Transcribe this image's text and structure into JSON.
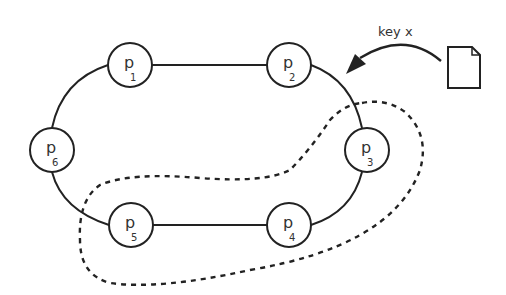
{
  "diagram": {
    "type": "ring-topology",
    "key_label": "key x",
    "nodes": [
      {
        "id": "p1",
        "label": "p",
        "sub": "1",
        "cx": 130,
        "cy": 65
      },
      {
        "id": "p2",
        "label": "p",
        "sub": "2",
        "cx": 289,
        "cy": 65
      },
      {
        "id": "p3",
        "label": "p",
        "sub": "3",
        "cx": 367,
        "cy": 150
      },
      {
        "id": "p4",
        "label": "p",
        "sub": "4",
        "cx": 289,
        "cy": 225
      },
      {
        "id": "p5",
        "label": "p",
        "sub": "5",
        "cx": 131,
        "cy": 225
      },
      {
        "id": "p6",
        "label": "p",
        "sub": "6",
        "cx": 52,
        "cy": 150
      }
    ],
    "edges": [
      [
        "p1",
        "p2"
      ],
      [
        "p2",
        "p3"
      ],
      [
        "p3",
        "p4"
      ],
      [
        "p4",
        "p5"
      ],
      [
        "p5",
        "p6"
      ],
      [
        "p6",
        "p1"
      ]
    ],
    "highlighted_region": {
      "style": "dashed",
      "contains": [
        "p3",
        "p4",
        "p5"
      ]
    },
    "document_icon": "document-icon",
    "arrow": {
      "from": "document",
      "to": "between p2 and p3"
    },
    "colors": {
      "stroke": "#222222",
      "background": "#ffffff"
    }
  }
}
